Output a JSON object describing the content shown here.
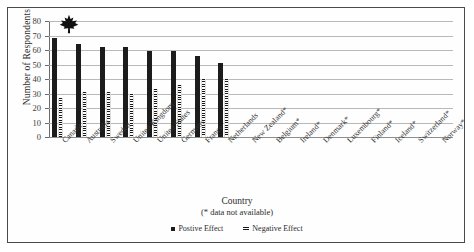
{
  "chart_data": {
    "type": "bar",
    "title": "",
    "xlabel": "Country",
    "xlabel_note": "(* data not available)",
    "ylabel": "Number of Respondents",
    "ylim": [
      0,
      80
    ],
    "yticks": [
      0,
      10,
      20,
      30,
      40,
      50,
      60,
      70,
      80
    ],
    "grid": true,
    "legend_position": "bottom",
    "categories": [
      "Canada",
      "Australia",
      "Sweden",
      "United Kingdom",
      "United States",
      "Germany",
      "France",
      "Netherlands",
      "New Zealand*",
      "Belgium*",
      "Ireland*",
      "Denmark*",
      "Luxembourg*",
      "Finland*",
      "Iceland*",
      "Switzerland*",
      "Norway*"
    ],
    "series": [
      {
        "name": "Postive Effect",
        "values": [
          68,
          64,
          62,
          62,
          59,
          59,
          56,
          51,
          null,
          null,
          null,
          null,
          null,
          null,
          null,
          null,
          null
        ]
      },
      {
        "name": "Negative Effect",
        "values": [
          27,
          31,
          31,
          30,
          33,
          36,
          40,
          40,
          null,
          null,
          null,
          null,
          null,
          null,
          null,
          null,
          null
        ]
      }
    ],
    "annotations": [
      {
        "name": "maple-leaf",
        "category": "Canada",
        "value": 80
      }
    ]
  },
  "legend": {
    "entries": [
      {
        "label": "Postive Effect",
        "marker": "solid-square-swatch"
      },
      {
        "label": "Negative Effect",
        "marker": "hatched-dash-swatch"
      }
    ]
  },
  "icons": {
    "maple_leaf": "maple-leaf-icon"
  }
}
